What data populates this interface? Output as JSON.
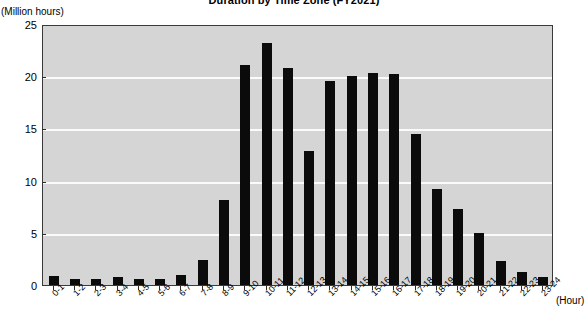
{
  "chart_data": {
    "type": "bar",
    "title": "Duration by Time Zone (FY2021)",
    "ylabel": "(Million hours)",
    "xlabel": "(Hour)",
    "ylim": [
      0,
      25
    ],
    "yticks": [
      0,
      5,
      10,
      15,
      20,
      25
    ],
    "grid": true,
    "legend": false,
    "bar_color": "#0b0b0b",
    "plot_background": "#d5d5d5",
    "categories": [
      "0-1",
      "1-2",
      "2-3",
      "3-4",
      "4-5",
      "5-6",
      "6-7",
      "7-8",
      "8-9",
      "9-10",
      "10-11",
      "11-12",
      "12-13",
      "13-14",
      "14-15",
      "15-16",
      "16-17",
      "17-18",
      "18-19",
      "19-20",
      "20-21",
      "21-22",
      "22-23",
      "23-24"
    ],
    "values": [
      0.9,
      0.6,
      0.6,
      0.8,
      0.6,
      0.6,
      1.0,
      2.4,
      8.1,
      21.1,
      23.2,
      20.8,
      12.8,
      19.5,
      20.0,
      20.3,
      20.2,
      14.5,
      9.2,
      7.3,
      5.0,
      2.3,
      1.2,
      0.8
    ]
  }
}
